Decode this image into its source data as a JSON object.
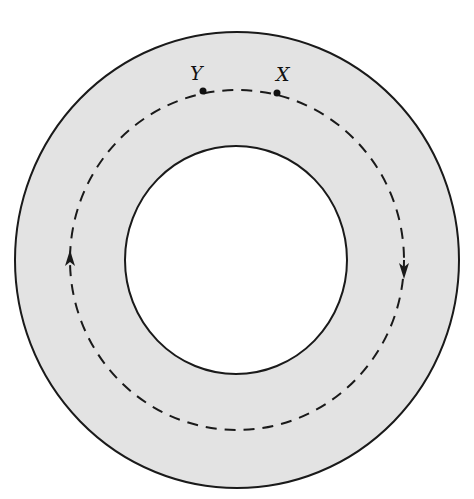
{
  "diagram": {
    "type": "annulus-with-circular-path",
    "colors": {
      "ring_fill": "#e3e3e3",
      "background": "#ffffff",
      "stroke": "#1a1a1a"
    },
    "outer_circle": {
      "cx": 237,
      "cy": 260,
      "rx": 222,
      "ry": 228
    },
    "inner_circle": {
      "cx": 236,
      "cy": 260,
      "rx": 111,
      "ry": 114
    },
    "dashed_path": {
      "cx": 237,
      "cy": 260,
      "rx": 167,
      "ry": 170,
      "direction": "clockwise"
    },
    "points": [
      {
        "id": "Y",
        "label": "Y",
        "x": 203,
        "y": 91,
        "label_x": 190,
        "label_y": 80
      },
      {
        "id": "X",
        "label": "X",
        "x": 277,
        "y": 93,
        "label_x": 276,
        "label_y": 81
      }
    ],
    "arrows": [
      {
        "position": "left",
        "x": 70,
        "y": 262,
        "direction": "up"
      },
      {
        "position": "right",
        "x": 404,
        "y": 267,
        "direction": "down"
      }
    ]
  }
}
